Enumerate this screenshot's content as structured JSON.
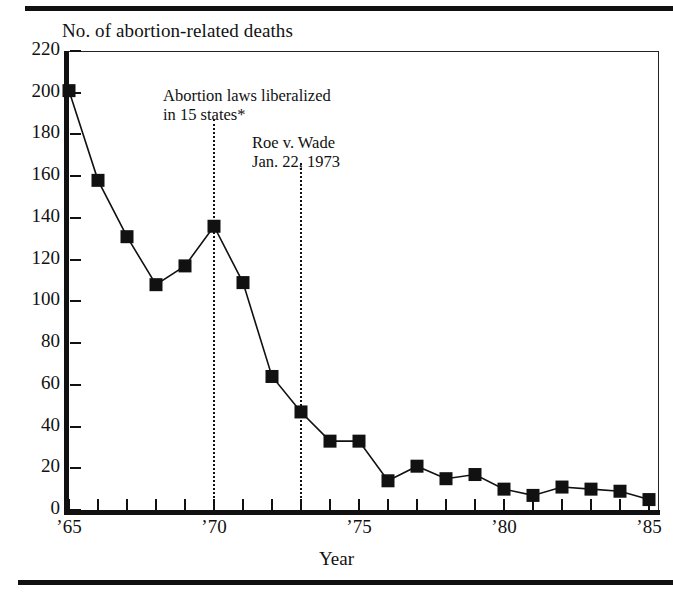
{
  "chart_data": {
    "type": "line",
    "title": "No. of abortion-related deaths",
    "xlabel": "Year",
    "ylabel": "",
    "x": [
      1965,
      1966,
      1967,
      1968,
      1969,
      1970,
      1971,
      1972,
      1973,
      1974,
      1975,
      1976,
      1977,
      1978,
      1979,
      1980,
      1981,
      1982,
      1983,
      1984,
      1985
    ],
    "values": [
      201,
      158,
      131,
      108,
      117,
      136,
      109,
      64,
      47,
      33,
      33,
      14,
      21,
      15,
      17,
      10,
      7,
      11,
      10,
      9,
      5
    ],
    "series": [
      {
        "name": "Abortion-related deaths",
        "values": [
          201,
          158,
          131,
          108,
          117,
          136,
          109,
          64,
          47,
          33,
          33,
          14,
          21,
          15,
          17,
          10,
          7,
          11,
          10,
          9,
          5
        ]
      }
    ],
    "ylim": [
      0,
      220
    ],
    "xlim": [
      1965,
      1985
    ],
    "ytick_labels": [
      "0",
      "20",
      "40",
      "60",
      "80",
      "100",
      "120",
      "140",
      "160",
      "180",
      "200",
      "220"
    ],
    "ytick_values": [
      0,
      20,
      40,
      60,
      80,
      100,
      120,
      140,
      160,
      180,
      200,
      220
    ],
    "xtick_label_values": [
      1965,
      1970,
      1975,
      1980,
      1985
    ],
    "xtick_labels": [
      "’65",
      "’70",
      "’75",
      "’80",
      "’85"
    ],
    "grid": false,
    "legend": "none",
    "marker": "square",
    "annotations": [
      {
        "id": "liberalized",
        "line1": "Abortion laws liberalized",
        "line2": "in 15 states*",
        "at_year": 1970
      },
      {
        "id": "roe",
        "line1": "Roe v. Wade",
        "line2": "Jan. 22, 1973",
        "at_year": 1973
      }
    ],
    "reference_lines": [
      1970,
      1973
    ],
    "colors": {
      "ink": "#111111",
      "background": "#ffffff"
    }
  },
  "axis_caption": "Year"
}
